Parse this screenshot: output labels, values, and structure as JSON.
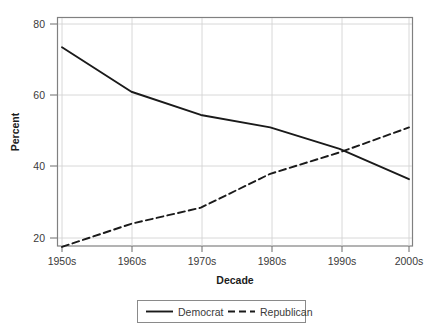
{
  "chart_data": {
    "type": "line",
    "title": "",
    "xlabel": "Decade",
    "ylabel": "Percent",
    "categories": [
      "1950s",
      "1960s",
      "1970s",
      "1980s",
      "1990s",
      "2000s"
    ],
    "series": [
      {
        "name": "Democrat",
        "style": "solid",
        "color": "#1a1a1a",
        "values": [
          73.5,
          61,
          54.5,
          51,
          45,
          36.5
        ]
      },
      {
        "name": "Republican",
        "style": "dashed",
        "color": "#1a1a1a",
        "values": [
          17.5,
          24,
          28.5,
          38,
          44,
          51
        ]
      }
    ],
    "ylim": [
      14,
      82
    ],
    "yticks": [
      20,
      40,
      60,
      80
    ],
    "ytick_labels": [
      "20",
      "40",
      "60",
      "80"
    ],
    "xtick_labels": [
      "1950s",
      "1960s",
      "1970s",
      "1980s",
      "1990s",
      "2000s"
    ],
    "grid": "horizontal-and-vertical",
    "legend_position": "bottom-center",
    "legend_entries": [
      "Democrat",
      "Republican"
    ]
  },
  "axes": {
    "y_title": "Percent",
    "x_title": "Decade",
    "y_tick_0": "20",
    "y_tick_1": "40",
    "y_tick_2": "60",
    "y_tick_3": "80",
    "x_tick_0": "1950s",
    "x_tick_1": "1960s",
    "x_tick_2": "1970s",
    "x_tick_3": "1980s",
    "x_tick_4": "1990s",
    "x_tick_5": "2000s"
  },
  "legend": {
    "entry_0": "Democrat",
    "entry_1": "Republican"
  }
}
